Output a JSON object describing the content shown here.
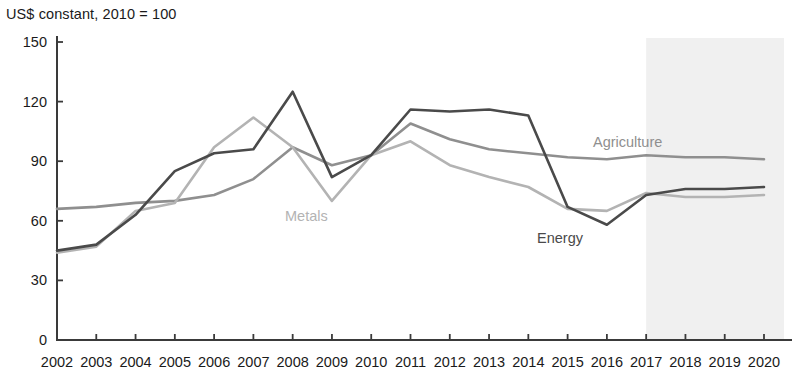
{
  "chart_data": {
    "type": "line",
    "title": "US$ constant, 2010 = 100",
    "xlabel": "",
    "ylabel": "",
    "ylim": [
      0,
      150
    ],
    "yticks": [
      0,
      30,
      60,
      90,
      120,
      150
    ],
    "grid": false,
    "legend_position": "inline-annotations",
    "categories": [
      "2002",
      "2003",
      "2004",
      "2005",
      "2006",
      "2007",
      "2008",
      "2009",
      "2010",
      "2011",
      "2012",
      "2013",
      "2014",
      "2015",
      "2016",
      "2017",
      "2018",
      "2019",
      "2020"
    ],
    "series": [
      {
        "name": "Energy",
        "color": "#4a4a4a",
        "values": [
          45,
          48,
          63,
          85,
          94,
          96,
          125,
          82,
          93,
          116,
          115,
          116,
          113,
          67,
          58,
          73,
          76,
          76,
          77
        ]
      },
      {
        "name": "Metals",
        "color": "#b3b3b3",
        "values": [
          44,
          47,
          65,
          69,
          97,
          112,
          97,
          70,
          93,
          100,
          88,
          82,
          77,
          66,
          65,
          74,
          72,
          72,
          73
        ]
      },
      {
        "name": "Agriculture",
        "color": "#8f8f8f",
        "values": [
          66,
          67,
          69,
          70,
          73,
          81,
          97,
          88,
          93,
          109,
          101,
          96,
          94,
          92,
          91,
          93,
          92,
          92,
          91
        ]
      }
    ],
    "annotations": [
      {
        "text": "Metals",
        "x_value": "2009",
        "color": "#b3b3b3"
      },
      {
        "text": "Energy",
        "x_value": "2015",
        "color": "#4a4a4a"
      },
      {
        "text": "Agriculture",
        "x_value": "2018",
        "color": "#8f8f8f"
      }
    ],
    "shaded_region": {
      "label": "forecast",
      "from": "2017",
      "to": "2020",
      "color": "#f0f0f0"
    }
  }
}
